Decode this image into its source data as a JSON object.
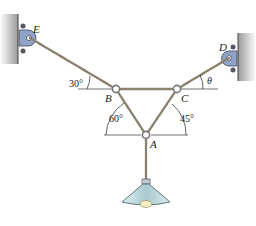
{
  "diagram": {
    "points": {
      "E": {
        "label": "E",
        "x": 30,
        "y": 38
      },
      "D": {
        "label": "D",
        "x": 229,
        "y": 58
      },
      "B": {
        "label": "B",
        "x": 116,
        "y": 89
      },
      "C": {
        "label": "C",
        "x": 177,
        "y": 89
      },
      "A": {
        "label": "A",
        "x": 146,
        "y": 135
      }
    },
    "angles": {
      "EB": "30°",
      "CD": "θ",
      "BA": "60°",
      "CA": "45°"
    },
    "colors": {
      "cable": "#8a8170",
      "wall": "#b8b8b8",
      "bracket": "#8fa3c8",
      "lamp": "#b7d3d8",
      "bulb": "#f3ecc0"
    }
  }
}
